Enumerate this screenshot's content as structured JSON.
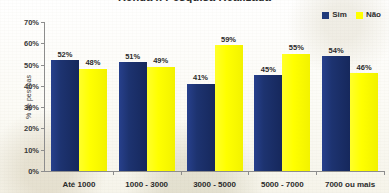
{
  "chart_data": {
    "type": "bar",
    "title": "Renda x Pesquisa Realizada",
    "xlabel": "",
    "ylabel": "% de pessoas",
    "ylim": [
      0,
      70
    ],
    "ytick_labels": [
      "0%",
      "10%",
      "20%",
      "30%",
      "40%",
      "50%",
      "60%",
      "70%"
    ],
    "ytick_values": [
      0,
      10,
      20,
      30,
      40,
      50,
      60,
      70
    ],
    "grid": false,
    "legend_position": "top-right",
    "categories": [
      "Até 1000",
      "1000 - 3000",
      "3000 - 5000",
      "5000 - 7000",
      "7000 ou mais"
    ],
    "series": [
      {
        "name": "Sim",
        "color": "#1F3A7A",
        "values": [
          52,
          51,
          41,
          45,
          54
        ],
        "labels": [
          "52%",
          "51%",
          "41%",
          "45%",
          "54%"
        ]
      },
      {
        "name": "Não",
        "color": "#FFFF00",
        "values": [
          48,
          49,
          59,
          55,
          46
        ],
        "labels": [
          "48%",
          "49%",
          "59%",
          "55%",
          "46%"
        ]
      }
    ]
  },
  "legend": {
    "items": [
      {
        "label": "Sim",
        "swatch": "#1F3A7A"
      },
      {
        "label": "Não",
        "swatch": "#FFFF00"
      }
    ]
  }
}
